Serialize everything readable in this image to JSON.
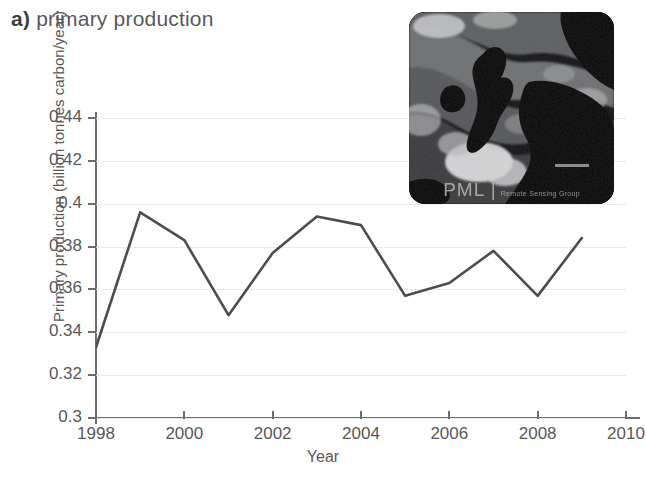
{
  "panel": {
    "letter": "a)",
    "title": "primary production"
  },
  "axes": {
    "x_label": "Year",
    "y_label": "Primary production (billion tonnes carbon/year)",
    "x_ticks": [
      "1998",
      "2000",
      "2002",
      "2004",
      "2006",
      "2008",
      "2010"
    ],
    "y_ticks": [
      "0.3",
      "0.32",
      "0.34",
      "0.36",
      "0.38",
      "0.4",
      "0.42",
      "0.44"
    ]
  },
  "inset": {
    "name": "satellite-chlorophyll-map-northwest-europe",
    "watermark_primary": "PML |",
    "watermark_secondary": "Remote Sensing Group"
  },
  "colors": {
    "line": "#4d4d4f",
    "axis": "#6d6d6f",
    "grid": "#e9e9ea",
    "text": "#58585a",
    "background": "#ffffff"
  },
  "chart_data": {
    "type": "line",
    "title": "a) primary production",
    "xlabel": "Year",
    "ylabel": "Primary production (billion tonnes carbon/year)",
    "xlim": [
      1998,
      2010
    ],
    "ylim": [
      0.3,
      0.44
    ],
    "xticks": [
      1998,
      2000,
      2002,
      2004,
      2006,
      2008,
      2010
    ],
    "yticks": [
      0.3,
      0.32,
      0.34,
      0.36,
      0.38,
      0.4,
      0.42,
      0.44
    ],
    "grid": true,
    "legend": false,
    "x": [
      1998,
      1999,
      2000,
      2001,
      2002,
      2003,
      2004,
      2005,
      2006,
      2007,
      2008,
      2009
    ],
    "values": [
      0.333,
      0.396,
      0.383,
      0.348,
      0.377,
      0.394,
      0.39,
      0.357,
      0.363,
      0.378,
      0.357,
      0.384
    ]
  }
}
